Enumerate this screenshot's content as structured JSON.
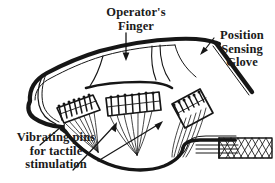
{
  "figure": {
    "background_color": "#ffffff",
    "ink_color": "#161616",
    "style": "black-and-white technical line drawing"
  },
  "labels": {
    "operator_finger": "Operator's\nFinger",
    "position_sensing_glove": "Position\nSensing\nGlove",
    "vibrating_pins": "Vibrating pins\nfor tactile\nstimulation"
  },
  "callouts": [
    {
      "name": "operator-finger-arrow",
      "target": "finger outline",
      "direction": "down"
    },
    {
      "name": "position-sensing-glove-arrow",
      "target": "glove band",
      "direction": "down-left"
    },
    {
      "name": "vibrating-pins-arrow-left",
      "target": "left pin array",
      "direction": "up-right"
    },
    {
      "name": "vibrating-pins-arrow-middle",
      "target": "middle pin array",
      "direction": "up-right"
    },
    {
      "name": "vibrating-pins-arrow-right",
      "target": "right pin array",
      "direction": "up-right"
    }
  ],
  "parts": {
    "pin_arrays": 3,
    "cable": "braided shielded cable",
    "fingertip": "rounded fingertip at left"
  }
}
